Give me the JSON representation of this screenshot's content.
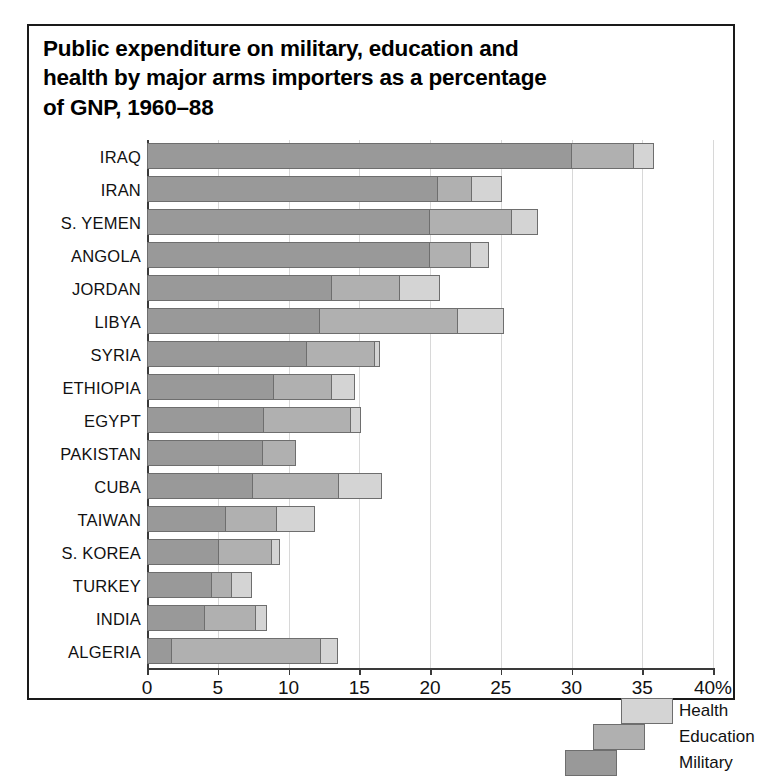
{
  "figure": {
    "title": "Public expenditure on military, education and\nhealth by major arms importers as a percentage\nof GNP, 1960–88"
  },
  "chart_data": {
    "type": "bar",
    "orientation": "horizontal",
    "stacked": true,
    "title": "Public expenditure on military, education and health by major arms importers as a percentage of GNP, 1960–88",
    "xlabel": "",
    "ylabel": "",
    "xlim": [
      0,
      40
    ],
    "xticks": [
      0,
      5,
      10,
      15,
      20,
      25,
      30,
      35,
      40
    ],
    "xticklabels": [
      "0",
      "5",
      "10",
      "15",
      "20",
      "25",
      "30",
      "35",
      "40%"
    ],
    "grid": "vertical",
    "legend_position": "inside-lower-right",
    "categories": [
      "IRAQ",
      "IRAN",
      "S. YEMEN",
      "ANGOLA",
      "JORDAN",
      "LIBYA",
      "SYRIA",
      "ETHIOPIA",
      "EGYPT",
      "PAKISTAN",
      "CUBA",
      "TAIWAN",
      "S. KOREA",
      "TURKEY",
      "INDIA",
      "ALGERIA"
    ],
    "series": [
      {
        "name": "Military",
        "color": "#999999",
        "values": [
          30.0,
          20.6,
          20.0,
          20.0,
          13.1,
          12.2,
          11.3,
          9.0,
          8.3,
          8.2,
          7.5,
          5.6,
          5.1,
          4.6,
          4.1,
          1.8
        ]
      },
      {
        "name": "Education",
        "color": "#b0b0b0",
        "values": [
          4.4,
          2.4,
          5.8,
          2.9,
          4.8,
          9.8,
          4.8,
          4.1,
          6.1,
          2.3,
          6.1,
          3.6,
          3.7,
          1.4,
          3.6,
          10.5
        ]
      },
      {
        "name": "Health",
        "color": "#d4d4d4",
        "values": [
          1.4,
          2.1,
          1.8,
          1.3,
          2.8,
          3.2,
          0.4,
          1.6,
          0.7,
          0.0,
          3.0,
          2.7,
          0.6,
          1.4,
          0.8,
          1.2
        ]
      }
    ],
    "totals": [
      35.8,
      25.1,
      27.6,
      24.2,
      20.7,
      25.2,
      16.5,
      14.7,
      15.1,
      10.5,
      16.6,
      11.9,
      9.4,
      7.4,
      8.5,
      13.5
    ]
  },
  "legend": {
    "items": [
      {
        "label": "Health",
        "color": "#d4d4d4"
      },
      {
        "label": "Education",
        "color": "#b0b0b0"
      },
      {
        "label": "Military",
        "color": "#999999"
      }
    ]
  }
}
